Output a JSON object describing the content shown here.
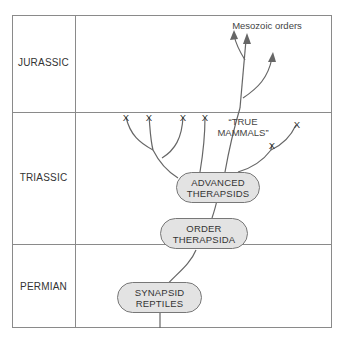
{
  "periods": [
    {
      "label": "JURASSIC"
    },
    {
      "label": "TRIASSIC"
    },
    {
      "label": "PERMIAN"
    }
  ],
  "nodes": {
    "synapsid_reptiles": {
      "line1": "SYNAPSID",
      "line2": "REPTILES"
    },
    "order_therapsida": {
      "line1": "ORDER",
      "line2": "THERAPSIDA"
    },
    "advanced_therapsids": {
      "line1": "ADVANCED",
      "line2": "THERAPSIDS"
    }
  },
  "annotations": {
    "true_mammals_line1": "“TRUE",
    "true_mammals_line2": "MAMMALS”",
    "mesozoic_orders": "Mesozoic orders"
  },
  "extinction_marker": "X",
  "colors": {
    "line": "#666666",
    "border": "#8a8a8a",
    "pill_fill": "#e3e3e3"
  }
}
